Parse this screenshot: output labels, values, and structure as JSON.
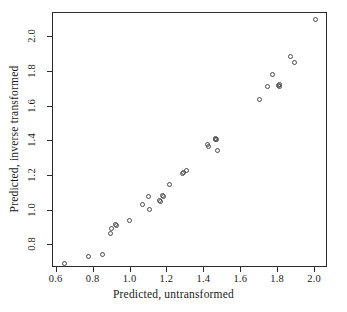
{
  "chart_data": {
    "type": "scatter",
    "title": "",
    "xlabel": "Predicted, untransformed",
    "ylabel": "Predicted, inverse transformed",
    "xlim": [
      0.58,
      2.07
    ],
    "ylim": [
      0.67,
      2.14
    ],
    "xticks": [
      "0.6",
      "0.8",
      "1.0",
      "1.2",
      "1.4",
      "1.6",
      "1.8",
      "2.0"
    ],
    "xtick_values": [
      0.6,
      0.8,
      1.0,
      1.2,
      1.4,
      1.6,
      1.8,
      2.0
    ],
    "yticks": [
      "0.8",
      "1.0",
      "1.2",
      "1.4",
      "1.6",
      "1.8",
      "2.0"
    ],
    "ytick_values": [
      0.8,
      1.0,
      1.2,
      1.4,
      1.6,
      1.8,
      2.0
    ],
    "grid": false,
    "legend": false,
    "marker": "open-circle",
    "marker_color": "#4a4a4a",
    "frame_color": "#2b2b2b",
    "background": "#ffffff",
    "points": [
      {
        "x": 0.645,
        "y": 0.695
      },
      {
        "x": 0.775,
        "y": 0.735
      },
      {
        "x": 0.848,
        "y": 0.75
      },
      {
        "x": 0.893,
        "y": 0.868
      },
      {
        "x": 0.898,
        "y": 0.897
      },
      {
        "x": 0.918,
        "y": 0.922
      },
      {
        "x": 0.925,
        "y": 0.915
      },
      {
        "x": 0.997,
        "y": 0.944
      },
      {
        "x": 1.063,
        "y": 1.038
      },
      {
        "x": 1.095,
        "y": 1.082
      },
      {
        "x": 1.103,
        "y": 1.01
      },
      {
        "x": 1.158,
        "y": 1.06
      },
      {
        "x": 1.163,
        "y": 1.052
      },
      {
        "x": 1.172,
        "y": 1.09
      },
      {
        "x": 1.178,
        "y": 1.085
      },
      {
        "x": 1.213,
        "y": 1.15
      },
      {
        "x": 1.283,
        "y": 1.215
      },
      {
        "x": 1.289,
        "y": 1.222
      },
      {
        "x": 1.302,
        "y": 1.23
      },
      {
        "x": 1.418,
        "y": 1.38
      },
      {
        "x": 1.424,
        "y": 1.368
      },
      {
        "x": 1.458,
        "y": 1.413
      },
      {
        "x": 1.463,
        "y": 1.418
      },
      {
        "x": 1.466,
        "y": 1.408
      },
      {
        "x": 1.472,
        "y": 1.35
      },
      {
        "x": 1.7,
        "y": 1.643
      },
      {
        "x": 1.742,
        "y": 1.718
      },
      {
        "x": 1.768,
        "y": 1.785
      },
      {
        "x": 1.8,
        "y": 1.722
      },
      {
        "x": 1.806,
        "y": 1.73
      },
      {
        "x": 1.808,
        "y": 1.715
      },
      {
        "x": 1.868,
        "y": 1.89
      },
      {
        "x": 1.888,
        "y": 1.855
      },
      {
        "x": 2.0,
        "y": 2.105
      }
    ]
  }
}
